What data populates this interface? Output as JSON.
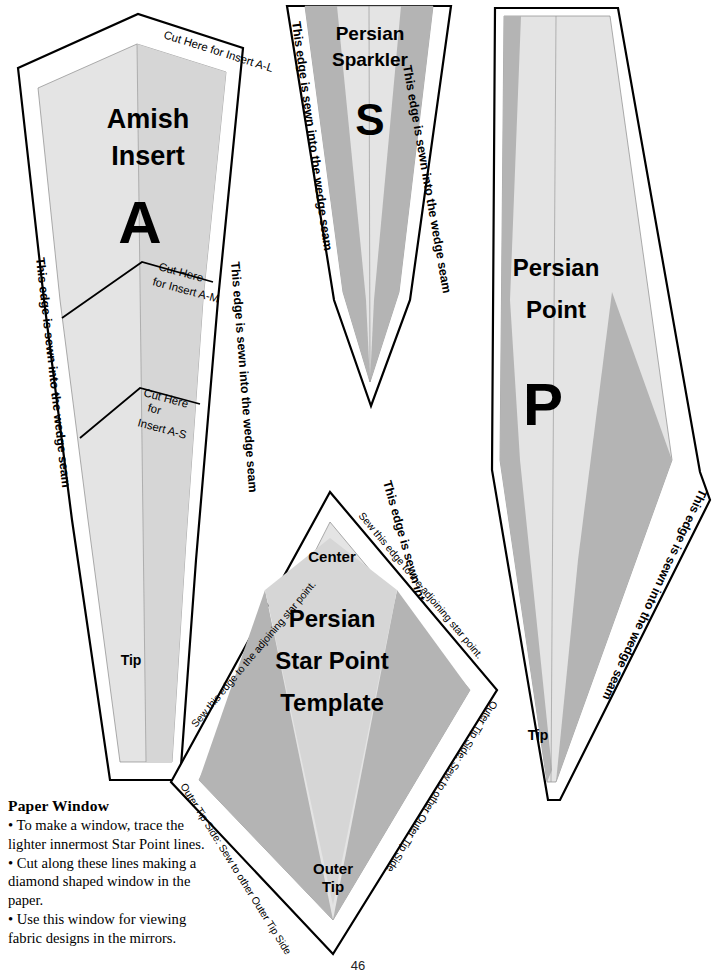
{
  "page": {
    "number": "46"
  },
  "edge_labels": {
    "wedge_seam": "This edge is sewn into the wedge seam",
    "adjoining_star_point": "Sew this edge to the adjoining star point.",
    "outer_tip_side": "Outer Tip Side: Sew to other Outer Tip Side"
  },
  "templates": {
    "amish_insert": {
      "title_line1": "Amish",
      "title_line2": "Insert",
      "letter": "A",
      "tip_label": "Tip",
      "cut_top": "Cut Here for Insert A-L",
      "cut_mid_line1": "Cut Here",
      "cut_mid_line2": "for Insert A-M",
      "cut_low_line1": "Cut Here",
      "cut_low_line2": "for",
      "cut_low_line3": "Insert A-S",
      "left_edge": "This edge is sewn into the wedge seam",
      "right_edge": "This edge is sewn into the wedge seam"
    },
    "persian_sparkler": {
      "title_line1": "Persian",
      "title_line2": "Sparkler",
      "letter": "S",
      "left_edge": "This edge is sewn into the wedge seam",
      "right_edge": "This edge is sewn into the wedge seam"
    },
    "persian_point": {
      "title_line1": "Persian",
      "title_line2": "Point",
      "letter": "P",
      "tip_label": "Tip",
      "left_edge": "This edge is sewn into the wedge seam",
      "right_edge": "This edge is sewn into the wedge seam"
    },
    "persian_star_point": {
      "title_line1": "Persian",
      "title_line2": "Star Point",
      "title_line3": "Template",
      "center_label": "Center",
      "outer_tip_line1": "Outer",
      "outer_tip_line2": "Tip",
      "edge_upper_left": "Sew this edge to the adjoining star point.",
      "edge_upper_right": "Sew this edge to the adjoining star point.",
      "edge_lower_left": "Outer Tip Side: Sew to other Outer Tip Side",
      "edge_lower_right": "Outer Tip Side: Sew to other Outer Tip Side"
    }
  },
  "paper_window": {
    "heading": "Paper Window",
    "bullets": [
      "• To make a window, trace the lighter innermost Star Point lines.",
      "• Cut along these lines making a diamond shaped window in the paper.",
      "• Use this window for viewing fabric designs in the mirrors."
    ]
  },
  "colors": {
    "light_gray": "#e4e4e4",
    "mid_gray": "#d6d6d6",
    "dark_gray": "#b4b4b4",
    "outline": "#000000",
    "paper": "#ffffff"
  }
}
